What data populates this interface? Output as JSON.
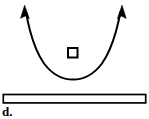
{
  "figure": {
    "panel_label": "d.",
    "background_color": "#ffffff",
    "stroke_color": "#000000",
    "fill_color": "#ffffff",
    "width": 149,
    "height": 119,
    "elements": {
      "trajectory_arc": {
        "name": "u-shaped-double-arrow-curve",
        "description": "Concave-up curved path with arrowheads at both upper ends pointing outward and upward",
        "left_arrow_tip": [
          25,
          6
        ],
        "right_arrow_tip": [
          122,
          6
        ],
        "vertex": [
          73,
          79
        ],
        "stroke_width": 2.0
      },
      "object_square": {
        "name": "small-hollow-square",
        "x": 67,
        "y": 47,
        "size": 11,
        "stroke_width": 2.0,
        "fill": "#ffffff"
      },
      "base_bar": {
        "name": "horizontal-hollow-bar",
        "x": 3,
        "y": 94,
        "width": 143,
        "height": 9,
        "stroke_width": 1.6,
        "fill": "#ffffff"
      }
    }
  }
}
